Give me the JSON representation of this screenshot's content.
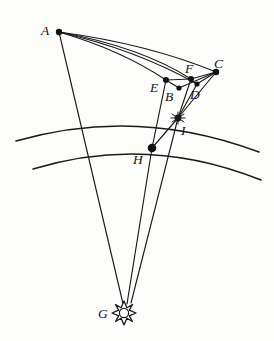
{
  "figure": {
    "background_color": "#fdfdfc",
    "ink_color": "#1b1b1b"
  },
  "points": [
    {
      "id": "A",
      "label": "A",
      "x": 59,
      "y": 32,
      "label_x": 44,
      "label_y": 30,
      "marker": "dot",
      "r": 3.0
    },
    {
      "id": "B",
      "label": "B",
      "x": 179,
      "y": 88,
      "label_x": 168,
      "label_y": 99,
      "marker": "dot",
      "r": 2.6
    },
    {
      "id": "C",
      "label": "C",
      "x": 216,
      "y": 72,
      "label_x": 216,
      "label_y": 65,
      "marker": "dot",
      "r": 3.0
    },
    {
      "id": "D",
      "label": "D",
      "x": 197,
      "y": 84,
      "label_x": 192,
      "label_y": 97,
      "marker": "dot",
      "r": 2.6
    },
    {
      "id": "E",
      "label": "E",
      "x": 166,
      "y": 80,
      "label_x": 153,
      "label_y": 90,
      "marker": "dot",
      "r": 3.0
    },
    {
      "id": "F",
      "label": "F",
      "x": 191,
      "y": 79,
      "label_x": 187,
      "label_y": 70,
      "marker": "dot",
      "r": 3.0
    },
    {
      "id": "G",
      "label": "G",
      "x": 124,
      "y": 313,
      "label_x": 101,
      "label_y": 316,
      "marker": "sun",
      "r": 7.5
    },
    {
      "id": "H",
      "label": "H",
      "x": 152,
      "y": 148,
      "label_x": 138,
      "label_y": 162,
      "marker": "dot",
      "r": 4.2
    },
    {
      "id": "I",
      "label": "I",
      "x": 178,
      "y": 118,
      "label_x": 183,
      "label_y": 133,
      "marker": "star",
      "r": 4.0
    }
  ],
  "arcs": [
    {
      "name": "outer-arc",
      "from_x": 16,
      "from_y": 141,
      "to_x": 259,
      "to_y": 152,
      "sweep_y": 112
    },
    {
      "name": "inner-arc",
      "from_x": 33,
      "from_y": 169,
      "to_x": 261,
      "to_y": 180,
      "sweep_y": 140
    }
  ],
  "curves": [
    {
      "name": "curve-A-E",
      "from": "A",
      "to": "E"
    },
    {
      "name": "curve-A-B",
      "from": "A",
      "to": "B"
    },
    {
      "name": "curve-A-F",
      "from": "A",
      "to": "F"
    },
    {
      "name": "curve-A-C",
      "from": "A",
      "to": "C"
    }
  ],
  "segments": [
    {
      "name": "segment-A-G",
      "from": "A",
      "to": "G"
    },
    {
      "name": "segment-E-F",
      "from": "E",
      "to": "F"
    },
    {
      "name": "segment-F-C",
      "from": "F",
      "to": "C"
    },
    {
      "name": "segment-E-B",
      "from": "E",
      "to": "B"
    },
    {
      "name": "segment-C-B",
      "from": "C",
      "to": "B"
    },
    {
      "name": "segment-C-D",
      "from": "C",
      "to": "D"
    },
    {
      "name": "segment-C-I",
      "from": "C",
      "to": "I"
    },
    {
      "name": "segment-F-I",
      "from": "F",
      "to": "I"
    },
    {
      "name": "segment-E-H",
      "from": "E",
      "to": "H"
    },
    {
      "name": "segment-D-I",
      "from": "D",
      "to": "I"
    },
    {
      "name": "segment-H-I",
      "from": "H",
      "to": "I"
    },
    {
      "name": "segment-H-G",
      "from": "H",
      "to": "G"
    },
    {
      "name": "segment-I-G",
      "from": "I",
      "to": "G"
    }
  ],
  "sun": {
    "name": "sun-symbol-G",
    "rays": 8,
    "outer_radius": 12,
    "inner_radius": 7.5,
    "core_radius": 4.6
  }
}
